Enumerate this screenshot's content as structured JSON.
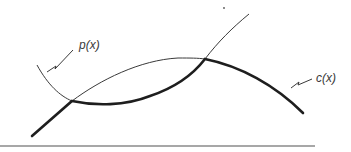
{
  "diagram": {
    "curves": [
      {
        "id": "p",
        "label": "p(x)",
        "style": "thin"
      },
      {
        "id": "c",
        "label": "c(x)",
        "style": "thick"
      }
    ],
    "labels": {
      "p": "p(x)",
      "c": "c(x)"
    },
    "colors": {
      "stroke": "#2a2a2a",
      "baseline": "#8a8a8a"
    }
  }
}
